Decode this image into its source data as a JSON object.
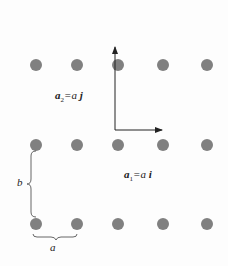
{
  "diagram": {
    "title": "",
    "lattice": {
      "rows_y": [
        65,
        145,
        224
      ],
      "cols_x": [
        36,
        77,
        118,
        163,
        207
      ],
      "dot_radius": 6,
      "dot_color": "#808080"
    },
    "axes": {
      "origin": [
        115,
        130
      ],
      "vertical_tip": [
        115,
        46
      ],
      "horizontal_tip": [
        163,
        130
      ],
      "color": "#222222"
    },
    "labels": {
      "a2": "a₂=a j",
      "a1": "a₁=a i",
      "b": "b",
      "a": "a"
    }
  }
}
